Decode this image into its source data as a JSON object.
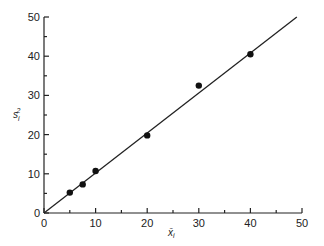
{
  "chart_data": {
    "type": "scatter",
    "title": "",
    "xlabel": "x̄ᵢ",
    "ylabel": "sᵢ²",
    "xlim": [
      0,
      50
    ],
    "ylim": [
      0,
      50
    ],
    "xticks": [
      0,
      10,
      20,
      30,
      40,
      50
    ],
    "yticks": [
      0,
      10,
      20,
      30,
      40,
      50
    ],
    "grid": false,
    "series": [
      {
        "name": "data",
        "type": "scatter",
        "x": [
          5,
          7.5,
          10,
          20,
          30,
          40
        ],
        "y": [
          5.2,
          7.3,
          10.7,
          19.8,
          32.5,
          40.5
        ]
      },
      {
        "name": "fit",
        "type": "line",
        "x": [
          0,
          49
        ],
        "y": [
          0,
          50
        ]
      }
    ]
  },
  "labels": {
    "x_axis": "x̄",
    "x_sub": "i",
    "y_axis": "s",
    "y_sub": "i",
    "y_sup": "2"
  }
}
